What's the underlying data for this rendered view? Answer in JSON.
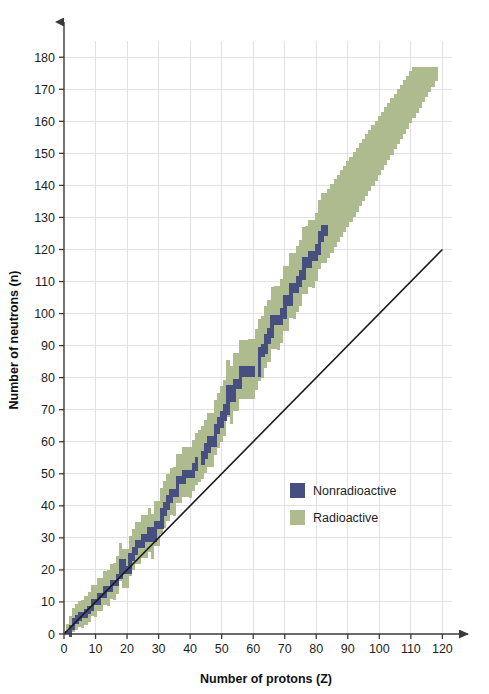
{
  "chart_data": {
    "type": "scatter",
    "title": "",
    "xlabel": "Number of protons (Z)",
    "ylabel": "Number of neutrons (n)",
    "xlim": [
      0,
      124
    ],
    "ylim": [
      0,
      186
    ],
    "xticks": [
      0,
      10,
      20,
      30,
      40,
      50,
      60,
      70,
      80,
      90,
      100,
      110,
      120
    ],
    "yticks": [
      0,
      10,
      20,
      30,
      40,
      50,
      60,
      70,
      80,
      90,
      100,
      110,
      120,
      130,
      140,
      150,
      160,
      170,
      180
    ],
    "grid": true,
    "legend_position": "center-right",
    "legend": [
      {
        "label": "Nonradioactive",
        "color": "#474e80"
      },
      {
        "label": "Radioactive",
        "color": "#aebb8f"
      }
    ],
    "reference_line": {
      "name": "n equals Z",
      "color": "#1a1a1a",
      "x": [
        0,
        120
      ],
      "y": [
        0,
        120
      ]
    },
    "series": [
      {
        "name": "Nonradioactive",
        "color": "#474e80",
        "description": "Band of stable nuclides, stepping above the n=Z line as Z increases, ending near Z=83, n=126",
        "points_z": [
          1,
          2,
          3,
          4,
          5,
          6,
          7,
          8,
          9,
          10,
          11,
          12,
          13,
          14,
          15,
          16,
          17,
          18,
          19,
          20,
          21,
          22,
          23,
          24,
          25,
          26,
          27,
          28,
          29,
          30,
          31,
          32,
          33,
          34,
          35,
          36,
          37,
          38,
          39,
          40,
          41,
          42,
          44,
          45,
          46,
          47,
          48,
          49,
          50,
          51,
          52,
          53,
          54,
          55,
          56,
          57,
          58,
          59,
          60,
          62,
          63,
          64,
          65,
          66,
          67,
          68,
          69,
          70,
          71,
          72,
          73,
          74,
          75,
          76,
          77,
          78,
          79,
          80,
          81,
          82,
          83
        ],
        "points_n": [
          0,
          2,
          4,
          5,
          6,
          6,
          7,
          8,
          10,
          10,
          12,
          12,
          14,
          14,
          16,
          16,
          18,
          22,
          20,
          20,
          24,
          26,
          28,
          28,
          30,
          30,
          32,
          30,
          34,
          34,
          38,
          40,
          42,
          44,
          44,
          48,
          48,
          50,
          50,
          50,
          52,
          54,
          56,
          58,
          60,
          60,
          64,
          66,
          68,
          70,
          76,
          74,
          78,
          78,
          82,
          82,
          82,
          82,
          82,
          88,
          89,
          92,
          94,
          98,
          98,
          98,
          100,
          104,
          104,
          108,
          108,
          110,
          112,
          116,
          116,
          118,
          118,
          120,
          124,
          126,
          126
        ]
      },
      {
        "name": "Radioactive",
        "color": "#aebb8f",
        "description": "Broad band of known radioactive nuclides surrounding the stability band, widening with Z and extending to about Z=118, n=177",
        "band_half_width_min": 3,
        "band_half_width_max": 13,
        "z_range": [
          1,
          118
        ],
        "n_max": 177
      }
    ]
  },
  "axes": {
    "x_arrow": "arrow-right",
    "y_arrow": "arrow-up"
  }
}
